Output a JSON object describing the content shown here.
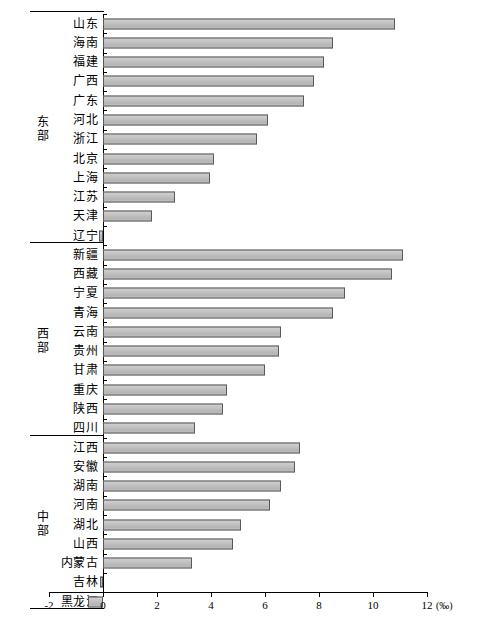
{
  "chart_data": {
    "type": "bar",
    "orientation": "horizontal",
    "title": "",
    "xlabel": "‰",
    "ylabel": "",
    "xlim": [
      -2,
      12
    ],
    "xticks": [
      -2,
      0,
      2,
      4,
      6,
      8,
      10,
      12
    ],
    "xtick_labels": [
      "-2",
      "0",
      "2",
      "4",
      "6",
      "8",
      "10",
      "12"
    ],
    "unit_label": "(‰)",
    "grid": false,
    "legend": false,
    "bar_fill_color": "#bdbdbd",
    "bar_border_color": "#5a5a5a",
    "axis_color": "#000000",
    "groups": [
      {
        "label": "东部",
        "categories": [
          "山东",
          "海南",
          "福建",
          "广西",
          "广东",
          "河北",
          "浙江",
          "北京",
          "上海",
          "江苏",
          "天津",
          "辽宁"
        ],
        "values": [
          10.8,
          8.5,
          8.2,
          7.8,
          7.45,
          6.1,
          5.7,
          4.1,
          3.95,
          2.65,
          1.8,
          -0.15
        ]
      },
      {
        "label": "西部",
        "categories": [
          "新疆",
          "西藏",
          "宁夏",
          "青海",
          "云南",
          "贵州",
          "甘肃",
          "重庆",
          "陕西",
          "四川"
        ],
        "values": [
          11.1,
          10.7,
          8.95,
          8.5,
          6.6,
          6.5,
          6.0,
          4.6,
          4.45,
          3.4
        ]
      },
      {
        "label": "中部",
        "categories": [
          "江西",
          "安徽",
          "湖南",
          "河南",
          "湖北",
          "山西",
          "内蒙古",
          "吉林",
          "黑龙江"
        ],
        "values": [
          7.3,
          7.1,
          6.6,
          6.2,
          5.1,
          4.8,
          3.3,
          -0.1,
          -0.55
        ]
      }
    ]
  }
}
